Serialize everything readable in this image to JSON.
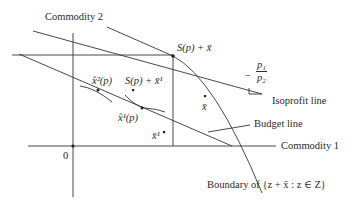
{
  "diagram": {
    "axes": {
      "y_label": "Commodity 2",
      "x_label": "Commodity 1",
      "origin_label": "0"
    },
    "labels": {
      "production_point": "S(p) + x̄",
      "production_point_1": "S(p) + x̄¹",
      "x_hat_2": "x̂²(p)",
      "x_hat_1": "x̂¹(p)",
      "x_bar": "x̄",
      "x_bar_1": "x̄¹",
      "slope_num": "p₁",
      "slope_den": "p₂",
      "slope_sign": "−",
      "isoprofit": "Isoprofit line",
      "budget": "Budget line",
      "boundary": "Boundary of {z + x̄ : z ∈ Z}"
    },
    "colors": {
      "line": "#333333",
      "background": "#ffffff"
    }
  }
}
